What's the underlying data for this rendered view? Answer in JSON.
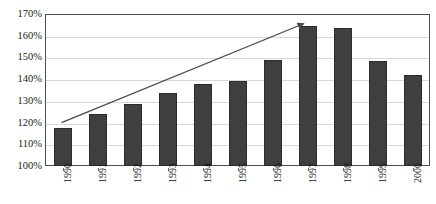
{
  "chart_data": {
    "type": "bar",
    "title": "",
    "subtitle": "",
    "xlabel": "",
    "ylabel": "",
    "categories": [
      "1990",
      "1991",
      "1992",
      "1993",
      "1994",
      "1995",
      "1996",
      "1997",
      "1998",
      "1999",
      "2000"
    ],
    "values": [
      117.5,
      124.0,
      128.5,
      133.5,
      138.0,
      139.0,
      149.0,
      164.5,
      163.5,
      148.5,
      142.0
    ],
    "value_unit": "%",
    "ylim": [
      100,
      170
    ],
    "ytick_step": 10,
    "ytick_labels": [
      "100%",
      "110%",
      "120%",
      "130%",
      "140%",
      "150%",
      "160%",
      "170%"
    ],
    "ytick_values": [
      100,
      110,
      120,
      130,
      140,
      150,
      160,
      170
    ],
    "grid": true,
    "grid_axis": "y",
    "legend": false,
    "legend_position": "none",
    "bar_color": "#3f3f3f",
    "bar_border_color": "#2b2b2b",
    "gridline_color": "#d9d9d9",
    "axis_border_color": "#4d4d4d",
    "text_color": "#1a1a1a",
    "annotations": [
      {
        "name": "trend-arrow",
        "type": "arrow",
        "label": "",
        "color": "#4a4a4a",
        "start": {
          "x_category": "1990",
          "y_value": 120.0
        },
        "end": {
          "x_category": "1997",
          "y_value": 165.5
        }
      }
    ]
  }
}
